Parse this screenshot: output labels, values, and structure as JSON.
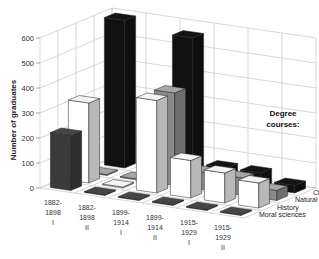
{
  "chart_data": {
    "type": "bar",
    "subtype": "3d-grouped",
    "title": "",
    "ylabel": "Number of graduates",
    "xlabel": "",
    "ylim": [
      0,
      600
    ],
    "yticks": [
      0,
      100,
      200,
      300,
      400,
      500,
      600
    ],
    "categories": [
      "1882-1898 I",
      "1882-1898 II",
      "1899-1914 I",
      "1899-1914 II",
      "1915-1929 I",
      "1915-1929 II"
    ],
    "category_lines": [
      [
        "1882-",
        "1898",
        "I"
      ],
      [
        "1882-",
        "1898",
        "II"
      ],
      [
        "1899-",
        "1914",
        "I"
      ],
      [
        "1899-",
        "1914",
        "II"
      ],
      [
        "1915-",
        "1929",
        "I"
      ],
      [
        "1915-",
        "1929",
        "II"
      ]
    ],
    "legend_title": [
      "Degree",
      "courses:"
    ],
    "series": [
      {
        "name": "Moral sciences",
        "color": "#3a3a3a",
        "values": [
          220,
          0,
          0,
          0,
          0,
          0
        ]
      },
      {
        "name": "History",
        "color": "#ffffff",
        "values": [
          320,
          0,
          370,
          150,
          120,
          100
        ]
      },
      {
        "name": "Natural sciences",
        "color": "#8a8a8a",
        "values": [
          0,
          0,
          370,
          70,
          70,
          40
        ]
      },
      {
        "name": "Classics",
        "color": "#111111",
        "values": [
          590,
          80,
          560,
          60,
          60,
          30
        ]
      }
    ],
    "grid": true,
    "legend_position": "right"
  }
}
